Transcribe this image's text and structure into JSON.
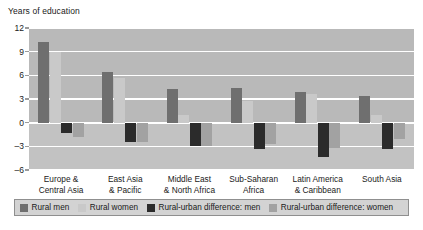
{
  "chart_data": {
    "type": "bar",
    "title": "",
    "subtitle": "",
    "ylabel": "Years of education",
    "xlabel": "",
    "ylim": [
      -6,
      12
    ],
    "yticks": [
      12,
      9,
      6,
      3,
      0,
      -3,
      -6
    ],
    "ytick_labels": [
      "12",
      "9",
      "6",
      "3",
      "0",
      "–3",
      "–6"
    ],
    "grid": true,
    "grid_axis": "y",
    "legend_position": "bottom",
    "categories": [
      "Europe & Central Asia",
      "East Asia & Pacific",
      "Middle East & North Africa",
      "Sub-Saharan Africa",
      "Latin America & Caribbean",
      "South Asia"
    ],
    "category_lines": [
      [
        "Europe &",
        "Central Asia"
      ],
      [
        "East Asia",
        "& Pacific"
      ],
      [
        "Middle East",
        "& North Africa"
      ],
      [
        "Sub-Saharan",
        "Africa"
      ],
      [
        "Latin America",
        "& Caribbean"
      ],
      [
        "South Asia",
        ""
      ]
    ],
    "series": [
      {
        "name": "Rural men",
        "color": "#6f6f6f",
        "values": [
          10.2,
          6.4,
          4.3,
          4.4,
          3.9,
          3.4
        ]
      },
      {
        "name": "Rural women",
        "color": "#c9c9c9",
        "values": [
          9.0,
          5.6,
          1.0,
          2.7,
          3.6,
          1.0
        ]
      },
      {
        "name": "Rural-urban difference: men",
        "color": "#2b2b2b",
        "values": [
          -1.3,
          -2.5,
          -3.0,
          -3.4,
          -4.3,
          -3.3
        ]
      },
      {
        "name": "Rural-urban difference: women",
        "color": "#a2a2a2",
        "values": [
          -1.8,
          -2.5,
          -3.0,
          -2.7,
          -3.2,
          -2.1
        ]
      }
    ]
  },
  "colors": {
    "plot_background": "#b9b9b9",
    "plot_background_lower": "#c2c2c2",
    "gridline": "#ffffff",
    "legend_background": "#d3d3d3",
    "legend_border": "#8f8f8f",
    "text": "#1a1a1a"
  }
}
